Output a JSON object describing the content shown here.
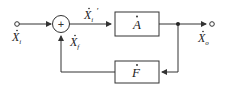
{
  "diagram": {
    "type": "feedback block diagram",
    "input_label": "X",
    "input_sub": "i",
    "error_label": "X",
    "error_sub": "i",
    "error_prime": "′",
    "feedback_label": "X",
    "feedback_sub": "f",
    "output_label": "X",
    "output_sub": "o",
    "summing_sign": "+",
    "forward_block": "A",
    "feedback_block": "F",
    "line_color": "#333333"
  }
}
